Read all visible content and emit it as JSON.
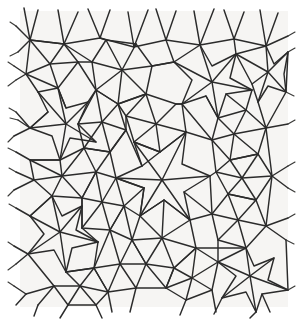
{
  "figure": {
    "domain": "Diagram",
    "kind": "random-triangulated-tiling",
    "title": "",
    "caption": "",
    "background_color": "#f6f5f3",
    "page_color": "#ffffff",
    "line_color": "#2b2b2b",
    "line_width": 1.45,
    "plot_area": {
      "x": 22,
      "y": 12,
      "width": 263,
      "height": 294
    },
    "cell_shapes_present": [
      "pentagon",
      "hexagon",
      "heptagon",
      "five-pointed-star",
      "triangle"
    ],
    "labels": [],
    "tick_labels": [],
    "legend": []
  },
  "chart_data": {
    "type": "diagram",
    "title": "",
    "xlabel": "",
    "ylabel": "",
    "grid": false,
    "legend_position": "none",
    "vertices": [
      [
        22,
        14
      ],
      [
        56,
        16
      ],
      [
        92,
        13
      ],
      [
        126,
        18
      ],
      [
        158,
        14
      ],
      [
        193,
        17
      ],
      [
        227,
        13
      ],
      [
        258,
        18
      ],
      [
        285,
        14
      ],
      [
        30,
        40
      ],
      [
        64,
        44
      ],
      [
        100,
        38
      ],
      [
        134,
        47
      ],
      [
        166,
        40
      ],
      [
        200,
        45
      ],
      [
        234,
        39
      ],
      [
        266,
        46
      ],
      [
        24,
        70
      ],
      [
        58,
        74
      ],
      [
        94,
        66
      ],
      [
        128,
        76
      ],
      [
        160,
        70
      ],
      [
        196,
        74
      ],
      [
        230,
        67
      ],
      [
        262,
        76
      ],
      [
        285,
        70
      ],
      [
        32,
        100
      ],
      [
        66,
        104
      ],
      [
        102,
        96
      ],
      [
        136,
        106
      ],
      [
        168,
        100
      ],
      [
        202,
        104
      ],
      [
        236,
        97
      ],
      [
        268,
        106
      ],
      [
        22,
        130
      ],
      [
        56,
        134
      ],
      [
        92,
        126
      ],
      [
        126,
        136
      ],
      [
        158,
        130
      ],
      [
        193,
        134
      ],
      [
        227,
        127
      ],
      [
        258,
        136
      ],
      [
        285,
        130
      ],
      [
        30,
        160
      ],
      [
        64,
        164
      ],
      [
        100,
        156
      ],
      [
        134,
        166
      ],
      [
        166,
        160
      ],
      [
        200,
        164
      ],
      [
        234,
        157
      ],
      [
        266,
        166
      ],
      [
        24,
        190
      ],
      [
        58,
        194
      ],
      [
        94,
        186
      ],
      [
        128,
        196
      ],
      [
        160,
        190
      ],
      [
        196,
        194
      ],
      [
        230,
        187
      ],
      [
        262,
        196
      ],
      [
        285,
        190
      ],
      [
        32,
        220
      ],
      [
        66,
        224
      ],
      [
        102,
        216
      ],
      [
        136,
        226
      ],
      [
        168,
        220
      ],
      [
        202,
        224
      ],
      [
        236,
        217
      ],
      [
        268,
        226
      ],
      [
        22,
        250
      ],
      [
        56,
        254
      ],
      [
        92,
        246
      ],
      [
        126,
        256
      ],
      [
        158,
        250
      ],
      [
        193,
        254
      ],
      [
        227,
        247
      ],
      [
        258,
        256
      ],
      [
        285,
        250
      ],
      [
        30,
        280
      ],
      [
        64,
        284
      ],
      [
        100,
        276
      ],
      [
        134,
        286
      ],
      [
        166,
        280
      ],
      [
        200,
        284
      ],
      [
        234,
        277
      ],
      [
        266,
        286
      ],
      [
        24,
        305
      ],
      [
        58,
        305
      ],
      [
        94,
        305
      ],
      [
        128,
        305
      ],
      [
        160,
        305
      ],
      [
        196,
        305
      ],
      [
        230,
        305
      ],
      [
        262,
        305
      ]
    ],
    "cell_count_approx": 46
  }
}
